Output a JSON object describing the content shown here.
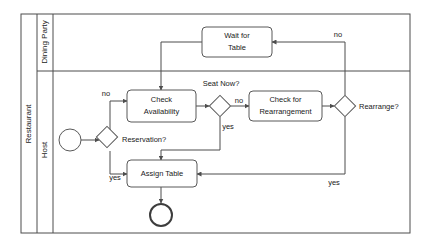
{
  "diagram": {
    "type": "bpmn-flowchart",
    "pool": {
      "name": "Restaurant"
    },
    "lanes": [
      {
        "id": "dining-party",
        "name": "Dining Party"
      },
      {
        "id": "host",
        "name": "Host"
      }
    ],
    "nodes": [
      {
        "id": "start",
        "type": "start-event",
        "lane": "host",
        "label": ""
      },
      {
        "id": "reservation",
        "type": "gateway",
        "lane": "host",
        "label": "Reservation?"
      },
      {
        "id": "check-availability",
        "type": "task",
        "lane": "host",
        "label": "Check Availability",
        "line1": "Check",
        "line2": "Availability"
      },
      {
        "id": "seat-now",
        "type": "gateway",
        "lane": "host",
        "label": "Seat Now?"
      },
      {
        "id": "check-rearrangement",
        "type": "task",
        "lane": "host",
        "label": "Check for Rearrangement",
        "line1": "Check for",
        "line2": "Rearrangement"
      },
      {
        "id": "rearrange",
        "type": "gateway",
        "lane": "host",
        "label": "Rearrange?"
      },
      {
        "id": "assign-table",
        "type": "task",
        "lane": "host",
        "label": "Assign Table",
        "line1": "Assign Table",
        "line2": ""
      },
      {
        "id": "wait-for-table",
        "type": "task",
        "lane": "dining-party",
        "label": "Wait for Table",
        "line1": "Wait for",
        "line2": "Table"
      },
      {
        "id": "end",
        "type": "end-event",
        "lane": "host",
        "label": ""
      }
    ],
    "edges": [
      {
        "from": "start",
        "to": "reservation",
        "label": ""
      },
      {
        "from": "reservation",
        "to": "check-availability",
        "label": "no"
      },
      {
        "from": "reservation",
        "to": "assign-table",
        "label": "yes"
      },
      {
        "from": "check-availability",
        "to": "seat-now",
        "label": ""
      },
      {
        "from": "seat-now",
        "to": "assign-table",
        "label": "yes"
      },
      {
        "from": "seat-now",
        "to": "check-rearrangement",
        "label": "no"
      },
      {
        "from": "check-rearrangement",
        "to": "rearrange",
        "label": ""
      },
      {
        "from": "rearrange",
        "to": "assign-table",
        "label": "yes"
      },
      {
        "from": "rearrange",
        "to": "wait-for-table",
        "label": "no"
      },
      {
        "from": "wait-for-table",
        "to": "check-availability",
        "label": ""
      },
      {
        "from": "assign-table",
        "to": "end",
        "label": ""
      }
    ],
    "edge_labels": {
      "reservation_no": "no",
      "reservation_yes": "yes",
      "seat_now_label": "Seat Now?",
      "seat_now_no": "no",
      "seat_now_yes": "yes",
      "rearrange_label": "Rearrange?",
      "rearrange_no": "no",
      "rearrange_yes": "yes",
      "reservation_label": "Reservation?"
    },
    "colors": {
      "stroke": "#4d4d4d",
      "node_stroke": "#595959",
      "background": "#ffffff",
      "text": "#1a1a1a"
    }
  }
}
